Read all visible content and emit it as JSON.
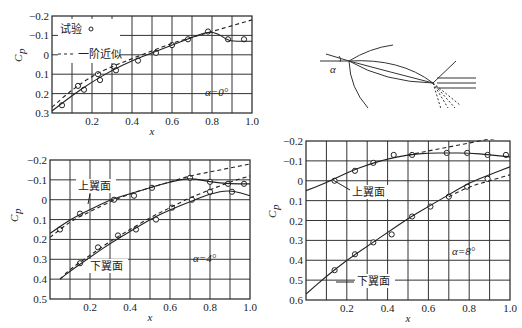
{
  "chart_data": [
    {
      "type": "line",
      "panel": "top-left",
      "annotation": "α=0°",
      "xlabel": "x",
      "ylabel": "Cp",
      "xlim": [
        0,
        1.0
      ],
      "ylim": [
        0.3,
        -0.2
      ],
      "y_inverted": true,
      "xticks": [
        "0.2",
        "0.4",
        "0.6",
        "0.8",
        "1.0"
      ],
      "yticks": [
        "−0.2",
        "−0.1",
        "0",
        "0.1",
        "0.2",
        "0.3"
      ],
      "grid": true,
      "legend": [
        {
          "label": "试验",
          "marker": "circle"
        },
        {
          "label": "一阶近似",
          "style": "dashed"
        }
      ],
      "series": [
        {
          "name": "试验",
          "style": "markers",
          "x": [
            0.05,
            0.13,
            0.16,
            0.23,
            0.24,
            0.31,
            0.32,
            0.43,
            0.52,
            0.6,
            0.68,
            0.78,
            0.88,
            0.96
          ],
          "y": [
            0.26,
            0.16,
            0.18,
            0.1,
            0.13,
            0.06,
            0.08,
            0.03,
            -0.01,
            -0.05,
            -0.08,
            -0.12,
            -0.08,
            -0.08
          ]
        },
        {
          "name": "试验曲线",
          "style": "solid",
          "x": [
            0.0,
            0.1,
            0.2,
            0.3,
            0.4,
            0.5,
            0.6,
            0.7,
            0.78,
            0.83,
            0.87,
            0.9,
            1.0
          ],
          "y": [
            0.29,
            0.21,
            0.14,
            0.08,
            0.03,
            -0.01,
            -0.05,
            -0.09,
            -0.12,
            -0.11,
            -0.08,
            -0.07,
            -0.07
          ]
        },
        {
          "name": "一阶近似",
          "style": "dashed",
          "x": [
            0.0,
            0.1,
            0.2,
            0.3,
            0.4,
            0.5,
            0.6,
            0.7,
            0.8,
            0.9,
            1.0
          ],
          "y": [
            0.27,
            0.18,
            0.11,
            0.06,
            0.02,
            -0.02,
            -0.06,
            -0.09,
            -0.12,
            -0.15,
            -0.18
          ]
        }
      ]
    },
    {
      "type": "line",
      "panel": "bottom-left",
      "annotation": "α=4°",
      "xlabel": "x",
      "ylabel": "Cp",
      "xlim": [
        0,
        1.0
      ],
      "ylim": [
        0.5,
        -0.2
      ],
      "y_inverted": true,
      "xticks": [
        "0.2",
        "0.4",
        "0.6",
        "0.8",
        "1.0"
      ],
      "yticks": [
        "−0.2",
        "−0.1",
        "0",
        "0.1",
        "0.2",
        "0.3",
        "0.4",
        "0.5"
      ],
      "grid": true,
      "labels": [
        "上翼面",
        "下翼面"
      ],
      "series": [
        {
          "name": "上翼面 试验",
          "style": "markers",
          "x": [
            0.05,
            0.15,
            0.32,
            0.42,
            0.51,
            0.7,
            0.8,
            0.89,
            0.97
          ],
          "y": [
            0.15,
            0.07,
            0.0,
            -0.02,
            -0.06,
            -0.11,
            -0.09,
            -0.08,
            -0.08
          ]
        },
        {
          "name": "上翼面 曲线",
          "style": "solid",
          "x": [
            0.0,
            0.1,
            0.2,
            0.3,
            0.4,
            0.5,
            0.6,
            0.7,
            0.8,
            0.9,
            1.0
          ],
          "y": [
            0.17,
            0.1,
            0.05,
            0.0,
            -0.03,
            -0.06,
            -0.09,
            -0.11,
            -0.09,
            -0.08,
            -0.08
          ]
        },
        {
          "name": "上翼面 一阶近似",
          "style": "dashed",
          "x": [
            0.0,
            0.1,
            0.2,
            0.3,
            0.4,
            0.5,
            0.6,
            0.7,
            0.8,
            0.9,
            1.0
          ],
          "y": [
            0.19,
            0.11,
            0.06,
            0.01,
            -0.03,
            -0.06,
            -0.09,
            -0.12,
            -0.14,
            -0.16,
            -0.18
          ]
        },
        {
          "name": "下翼面 试验",
          "style": "markers",
          "x": [
            0.15,
            0.24,
            0.34,
            0.43,
            0.53,
            0.61,
            0.71,
            0.8,
            0.91
          ],
          "y": [
            0.32,
            0.24,
            0.18,
            0.15,
            0.1,
            0.04,
            0.0,
            -0.04,
            -0.04
          ]
        },
        {
          "name": "下翼面 曲线",
          "style": "solid",
          "x": [
            0.05,
            0.1,
            0.2,
            0.3,
            0.4,
            0.5,
            0.6,
            0.7,
            0.8,
            0.9,
            1.0
          ],
          "y": [
            0.4,
            0.36,
            0.29,
            0.22,
            0.16,
            0.1,
            0.05,
            0.01,
            -0.03,
            -0.05,
            -0.02
          ]
        },
        {
          "name": "下翼面 一阶近似",
          "style": "dashed",
          "x": [
            0.05,
            0.1,
            0.2,
            0.3,
            0.4,
            0.5,
            0.6,
            0.7,
            0.8,
            0.9,
            1.0
          ],
          "y": [
            0.4,
            0.35,
            0.28,
            0.21,
            0.15,
            0.09,
            0.04,
            -0.01,
            -0.05,
            -0.09,
            -0.12
          ]
        }
      ]
    },
    {
      "type": "line",
      "panel": "bottom-right",
      "annotation": "α=8°",
      "xlabel": "x",
      "ylabel": "Cp",
      "xlim": [
        0,
        1.0
      ],
      "ylim": [
        0.6,
        -0.2
      ],
      "y_inverted": true,
      "xticks": [
        "0.2",
        "0.4",
        "0.6",
        "0.8",
        "1.0"
      ],
      "yticks": [
        "−0.2",
        "−0.1",
        "0",
        "0.1",
        "0.2",
        "0.3",
        "0.4",
        "0.5",
        "0.6"
      ],
      "grid": true,
      "labels": [
        "上翼面",
        "下翼面"
      ],
      "series": [
        {
          "name": "上翼面 试验",
          "style": "markers",
          "x": [
            0.14,
            0.24,
            0.33,
            0.43,
            0.52,
            0.69,
            0.79,
            0.89,
            0.98
          ],
          "y": [
            0.0,
            -0.05,
            -0.09,
            -0.13,
            -0.13,
            -0.14,
            -0.14,
            -0.13,
            -0.13
          ]
        },
        {
          "name": "上翼面 曲线",
          "style": "solid",
          "x": [
            0.0,
            0.1,
            0.2,
            0.3,
            0.4,
            0.5,
            0.6,
            0.7,
            0.8,
            0.9,
            1.0
          ],
          "y": [
            0.05,
            0.01,
            -0.04,
            -0.08,
            -0.11,
            -0.13,
            -0.14,
            -0.14,
            -0.14,
            -0.13,
            -0.12
          ]
        },
        {
          "name": "上翼面 一阶近似",
          "style": "dashed",
          "x": [
            0.5,
            0.6,
            0.7,
            0.8,
            0.9,
            1.0
          ],
          "y": [
            -0.13,
            -0.15,
            -0.17,
            -0.19,
            -0.21,
            -0.22
          ]
        },
        {
          "name": "下翼面 试验",
          "style": "markers",
          "x": [
            0.14,
            0.24,
            0.33,
            0.42,
            0.52,
            0.61,
            0.7,
            0.79,
            0.89
          ],
          "y": [
            0.45,
            0.37,
            0.31,
            0.27,
            0.18,
            0.13,
            0.08,
            0.03,
            -0.01
          ]
        },
        {
          "name": "下翼面 曲线",
          "style": "solid",
          "x": [
            0.0,
            0.1,
            0.2,
            0.3,
            0.4,
            0.5,
            0.6,
            0.7,
            0.8,
            0.9,
            1.0
          ],
          "y": [
            0.57,
            0.48,
            0.4,
            0.33,
            0.26,
            0.19,
            0.13,
            0.07,
            0.01,
            -0.03,
            -0.07
          ]
        },
        {
          "name": "下翼面 一阶近似",
          "style": "dashed",
          "x": [
            0.7,
            0.8,
            0.9,
            1.0
          ],
          "y": [
            0.08,
            0.03,
            0.0,
            -0.03
          ]
        }
      ]
    }
  ],
  "diagram": {
    "angle_label": "α"
  },
  "axis": {
    "y_label_main": "C",
    "y_label_sub": "p",
    "x_label": "x"
  }
}
